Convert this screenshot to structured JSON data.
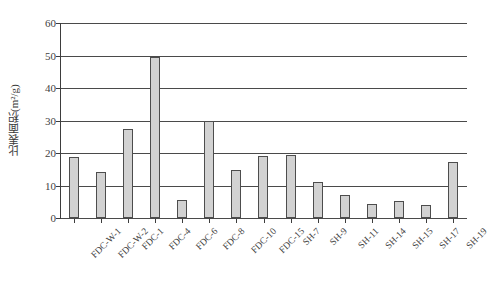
{
  "chart_data": {
    "type": "bar",
    "title": "",
    "xlabel": "",
    "ylabel": "比表面积(m²/g)",
    "ylim": [
      0,
      60
    ],
    "yticks": [
      0,
      10,
      20,
      30,
      40,
      50,
      60
    ],
    "ytick_labels": [
      "0",
      "10",
      "20",
      "30",
      "40",
      "50",
      "60"
    ],
    "grid": true,
    "legend": false,
    "categories": [
      "FDC-W-1",
      "FDC-W-2",
      "FDC-1",
      "FDC-4",
      "FDC-6",
      "FDC-8",
      "FDC-10",
      "FDC-15",
      "SH-7",
      "SH-9",
      "SH-11",
      "SH-14",
      "SH-15",
      "SH-17",
      "SH-19"
    ],
    "values": [
      18.7,
      14.2,
      27.4,
      49.6,
      5.5,
      29.9,
      14.8,
      19.1,
      19.4,
      11.1,
      7.1,
      4.3,
      5.3,
      4.0,
      17.3
    ],
    "bar_fill_color": "#d2d2d2",
    "bar_border_color": "#4d4d4d",
    "axis_color": "#3d3d3d",
    "grid_color": "#4a4a4a"
  }
}
